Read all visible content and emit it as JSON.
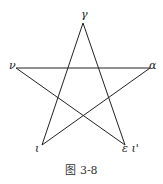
{
  "diagram": {
    "type": "pentagram",
    "vertices": [
      {
        "id": "top",
        "label": "γ",
        "x": 83,
        "y": 23
      },
      {
        "id": "left",
        "label": "ν",
        "x": 16,
        "y": 68
      },
      {
        "id": "right",
        "label": "α",
        "x": 150,
        "y": 68
      },
      {
        "id": "bottom_left",
        "label": "ι",
        "x": 42,
        "y": 145
      },
      {
        "id": "bottom_right",
        "label": "ε ι'",
        "x": 125,
        "y": 145
      }
    ],
    "caption": "图 3-8"
  }
}
